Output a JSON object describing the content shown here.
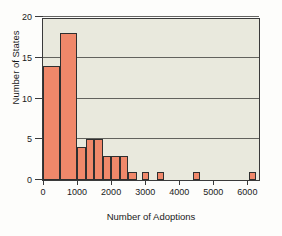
{
  "chart_data": {
    "type": "bar",
    "title": "",
    "subtitle": "",
    "xlabel": "Number of Adoptions",
    "ylabel": "Number of States",
    "xlim": [
      0,
      6400
    ],
    "ylim": [
      0,
      20
    ],
    "bin_width": 500,
    "grid": true,
    "legend": null,
    "xticks": [
      0,
      1000,
      2000,
      3000,
      4000,
      5000,
      6000
    ],
    "xtick_labels": [
      "0",
      "1000",
      "2000",
      "3000",
      "4000",
      "5000",
      "6000"
    ],
    "yticks": [
      0,
      5,
      10,
      15,
      20
    ],
    "ytick_labels": [
      "0",
      "5",
      "10",
      "15",
      "20"
    ],
    "bin_edges": [
      0,
      500,
      1000,
      1500,
      2000,
      2500,
      3000,
      3500,
      4000,
      4500,
      5000,
      5500,
      6000,
      6500
    ],
    "values": [
      14,
      18,
      4,
      5,
      3,
      3,
      1,
      0,
      1,
      0,
      1,
      0,
      0,
      1
    ],
    "bars": [
      {
        "x0": 0,
        "x1": 500,
        "value": 14
      },
      {
        "x0": 500,
        "x1": 1000,
        "value": 18
      },
      {
        "x0": 1000,
        "x1": 1250,
        "value": 4
      },
      {
        "x0": 1250,
        "x1": 1500,
        "value": 5
      },
      {
        "x0": 1500,
        "x1": 1750,
        "value": 5
      },
      {
        "x0": 1750,
        "x1": 2000,
        "value": 3
      },
      {
        "x0": 2000,
        "x1": 2250,
        "value": 3
      },
      {
        "x0": 2250,
        "x1": 2500,
        "value": 3
      },
      {
        "x0": 2500,
        "x1": 2750,
        "value": 1
      },
      {
        "x0": 2900,
        "x1": 3100,
        "value": 1
      },
      {
        "x0": 3350,
        "x1": 3550,
        "value": 1
      },
      {
        "x0": 4400,
        "x1": 4600,
        "value": 1
      },
      {
        "x0": 6050,
        "x1": 6250,
        "value": 1
      }
    ],
    "colors": {
      "bar_fill": "#f0886a",
      "bar_edge": "#2f2f2f",
      "plot_background": "#e9e9dd",
      "gridline": "#4a4a46",
      "axis": "#3a3a3a",
      "figure_background": "#fdfdfb",
      "text": "#1a1a1a"
    }
  }
}
